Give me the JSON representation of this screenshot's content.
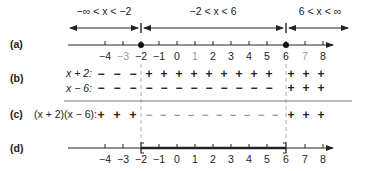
{
  "figure": {
    "intervals": [
      {
        "label": "−∞ < x < −2",
        "from": -6,
        "to": -2
      },
      {
        "label": "−2 < x < 6",
        "from": -2,
        "to": 6
      },
      {
        "label": "6 < x < ∞",
        "from": 6,
        "to": 9
      }
    ],
    "critical_points": [
      -2,
      6
    ],
    "ticks": [
      -4,
      -3,
      -2,
      -1,
      0,
      1,
      2,
      3,
      4,
      5,
      6,
      7,
      8
    ],
    "tick_labels": [
      "−4",
      "−3",
      "−2",
      "−1",
      "0",
      "1",
      "2",
      "3",
      "4",
      "5",
      "6",
      "7",
      "8"
    ],
    "gray_tick_labels_row_a": [
      "−3",
      "7"
    ],
    "rows": {
      "a": {
        "label": "(a)"
      },
      "b": {
        "label": "(b)",
        "factor1": {
          "label": "x + 2:",
          "signs_left": "− − −",
          "signs_mid": "+ + + + + + + +",
          "signs_right": "+ + +"
        },
        "factor2": {
          "label": "x − 6:",
          "signs_left": "− − −",
          "signs_mid": "− − − − − − − −",
          "signs_right": "+ + +"
        }
      },
      "c": {
        "label": "(c)",
        "expr": "(x + 2)(x − 6):",
        "signs_left": "+ + +",
        "signs_mid": "− − − − − − − − − −",
        "signs_right": "+ + +"
      },
      "d": {
        "label": "(d)",
        "solution_interval": "[−2, 6]"
      }
    },
    "colors": {
      "ink": "#222222",
      "gray": "#9a9a9a",
      "rule": "#777777"
    }
  }
}
